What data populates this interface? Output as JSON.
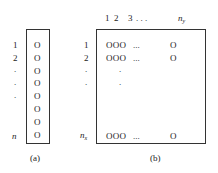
{
  "panel_a": {
    "row_labels": [
      "1",
      "2",
      ".",
      ".",
      ".",
      "",
      "",
      "n"
    ],
    "cells": [
      "O",
      "O",
      "O",
      "O",
      "O",
      "O",
      "O",
      "O"
    ],
    "caption": "(a)"
  },
  "panel_b": {
    "column_labels": [
      "1",
      "2",
      "3",
      ". . .",
      "n",
      "y"
    ],
    "row_labels": [
      "1",
      "2",
      ".",
      ".",
      "n",
      "x"
    ],
    "row1": {
      "cells": "O O O",
      "ellipsis": "...",
      "last": "O"
    },
    "row2": {
      "cells": "O O O",
      "ellipsis": "...",
      "last": "O"
    },
    "vdots": [
      ".",
      "."
    ],
    "rown": {
      "cells": "O O O",
      "ellipsis": "...",
      "last": "O"
    },
    "caption": "(b)"
  }
}
